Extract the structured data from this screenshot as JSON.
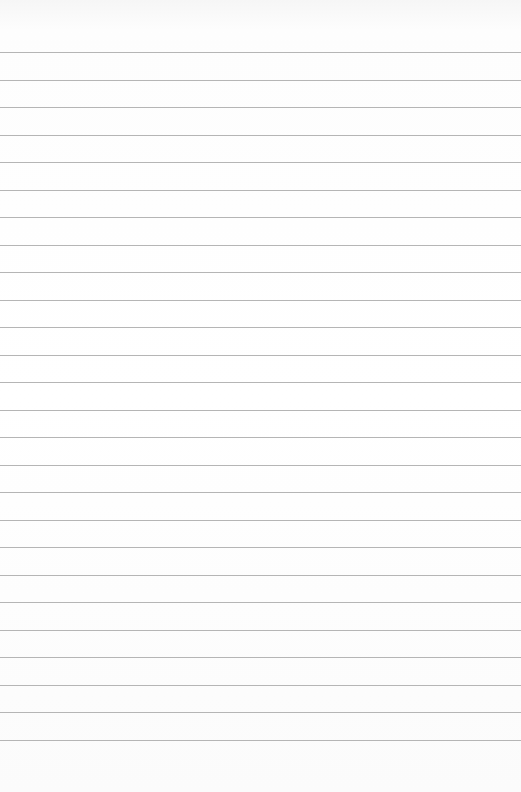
{
  "paper": {
    "type": "ruled-lined-paper",
    "background_color": "#ffffff",
    "line_color": "#a8a8a8",
    "line_count": 26,
    "first_line_y": 52,
    "line_spacing": 27.5
  }
}
